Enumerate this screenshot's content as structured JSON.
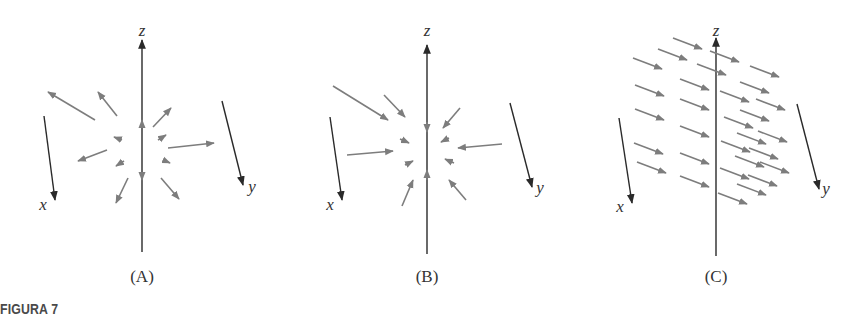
{
  "figure": {
    "caption": "FIGURA 7",
    "colors": {
      "axis": "#2a2a2a",
      "vector": "#7d7d7d",
      "caption": "#4a4a4a",
      "background": "#ffffff"
    },
    "panels": [
      {
        "id": "A",
        "label": "(A)",
        "description": "Radial vector field pointing outward from origin",
        "axes": {
          "x_label": "x",
          "y_label": "y",
          "z_label": "z"
        },
        "origin": [
          142,
          150
        ],
        "axis_lines": {
          "z": [
            [
              142,
              252
            ],
            [
              142,
              40
            ]
          ],
          "x": [
            [
              44,
              116
            ],
            [
              55,
              200
            ]
          ],
          "y": [
            [
              222,
              101
            ],
            [
              243,
              185
            ]
          ]
        },
        "axis_markers": [
          [
            [
              142,
              128
            ],
            [
              142,
              120
            ]
          ],
          [
            [
              142,
              172
            ],
            [
              142,
              180
            ]
          ],
          [
            [
              122,
              140
            ],
            [
              114,
              137
            ]
          ],
          [
            [
              163,
              160
            ],
            [
              170,
              163
            ]
          ],
          [
            [
              124,
              161
            ],
            [
              116,
              166
            ]
          ],
          [
            [
              158,
              140
            ],
            [
              166,
              135
            ]
          ]
        ],
        "vectors": [
          [
            [
              95,
              120
            ],
            [
              48,
              92
            ]
          ],
          [
            [
              117,
              116
            ],
            [
              98,
              92
            ]
          ],
          [
            [
              153,
              127
            ],
            [
              171,
              108
            ]
          ],
          [
            [
              168,
              148
            ],
            [
              214,
              143
            ]
          ],
          [
            [
              107,
              150
            ],
            [
              78,
              161
            ]
          ],
          [
            [
              128,
              178
            ],
            [
              116,
              203
            ]
          ],
          [
            [
              161,
              178
            ],
            [
              179,
              199
            ]
          ]
        ],
        "label_positions": {
          "z": [
            142,
            36
          ],
          "x": [
            43,
            210
          ],
          "y": [
            252,
            192
          ],
          "panel": [
            142,
            282
          ]
        }
      },
      {
        "id": "B",
        "label": "(B)",
        "description": "Radial vector field pointing inward toward origin",
        "axes": {
          "x_label": "x",
          "y_label": "y",
          "z_label": "z"
        },
        "origin": [
          427,
          151
        ],
        "axis_lines": {
          "z": [
            [
              427,
              254
            ],
            [
              427,
              45
            ]
          ],
          "x": [
            [
              330,
              117
            ],
            [
              342,
              200
            ]
          ],
          "y": [
            [
              510,
              103
            ],
            [
              532,
              187
            ]
          ]
        },
        "axis_markers": [
          [
            [
              427,
              122
            ],
            [
              427,
              132
            ]
          ],
          [
            [
              427,
              180
            ],
            [
              427,
              170
            ]
          ],
          [
            [
              400,
              139
            ],
            [
              409,
              143
            ]
          ],
          [
            [
              454,
              163
            ],
            [
              445,
              159
            ]
          ],
          [
            [
              405,
              165
            ],
            [
              413,
              161
            ]
          ],
          [
            [
              449,
              138
            ],
            [
              441,
              142
            ]
          ]
        ],
        "vectors": [
          [
            [
              333,
              86
            ],
            [
              388,
              120
            ]
          ],
          [
            [
              384,
              95
            ],
            [
              405,
              117
            ]
          ],
          [
            [
              460,
              108
            ],
            [
              443,
              128
            ]
          ],
          [
            [
              347,
              155
            ],
            [
              393,
              151
            ]
          ],
          [
            [
              502,
              144
            ],
            [
              458,
              148
            ]
          ],
          [
            [
              402,
              206
            ],
            [
              413,
              180
            ]
          ],
          [
            [
              466,
              200
            ],
            [
              449,
              180
            ]
          ]
        ],
        "label_positions": {
          "z": [
            427,
            36
          ],
          "x": [
            330,
            210
          ],
          "y": [
            540,
            193
          ],
          "panel": [
            427,
            282
          ]
        }
      },
      {
        "id": "C",
        "label": "(C)",
        "description": "Constant vector field: parallel arrows all pointing in +y direction",
        "axes": {
          "x_label": "x",
          "y_label": "y",
          "z_label": "z"
        },
        "origin": [
          716,
          153
        ],
        "axis_lines": {
          "z": [
            [
              716,
              256
            ],
            [
              716,
              38
            ]
          ],
          "x": [
            [
              619,
              118
            ],
            [
              632,
              203
            ]
          ],
          "y": [
            [
              797,
              104
            ],
            [
              819,
              189
            ]
          ]
        },
        "arrow_delta": [
          29,
          11
        ],
        "arrow_starts": [
          [
            673,
            38
          ],
          [
            658,
            49
          ],
          [
            710,
            51
          ],
          [
            633,
            58
          ],
          [
            697,
            64
          ],
          [
            750,
            66
          ],
          [
            680,
            79
          ],
          [
            740,
            82
          ],
          [
            635,
            85
          ],
          [
            720,
            91
          ],
          [
            756,
            99
          ],
          [
            680,
            99
          ],
          [
            740,
            110
          ],
          [
            635,
            109
          ],
          [
            724,
            117
          ],
          [
            758,
            131
          ],
          [
            680,
            126
          ],
          [
            737,
            133
          ],
          [
            634,
            143
          ],
          [
            680,
            153
          ],
          [
            721,
            141
          ],
          [
            749,
            148
          ],
          [
            735,
            156
          ],
          [
            637,
            162
          ],
          [
            760,
            162
          ],
          [
            720,
            168
          ],
          [
            680,
            176
          ],
          [
            748,
            175
          ],
          [
            737,
            184
          ],
          [
            718,
            193
          ]
        ],
        "label_positions": {
          "z": [
            716,
            36
          ],
          "x": [
            620,
            212
          ],
          "y": [
            826,
            194
          ],
          "panel": [
            716,
            282
          ]
        }
      }
    ]
  }
}
